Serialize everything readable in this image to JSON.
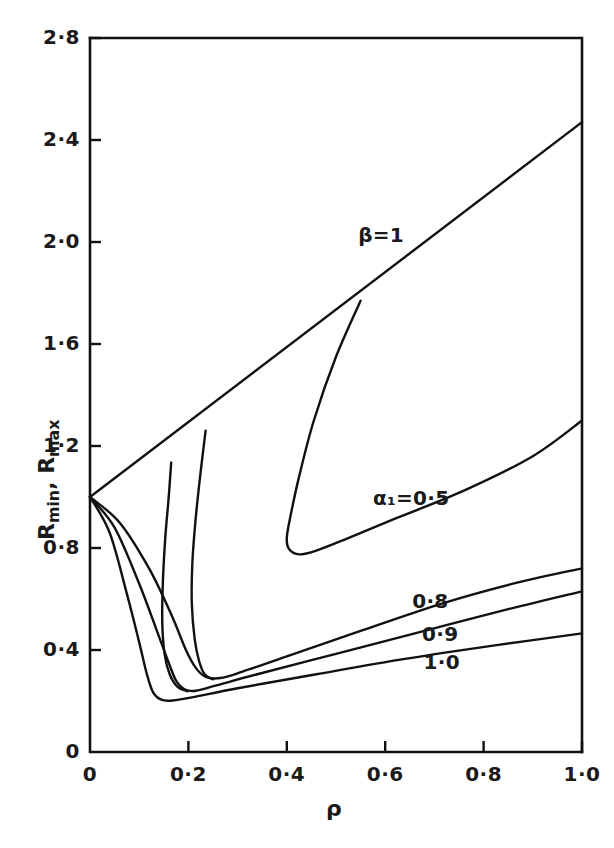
{
  "chart_data": {
    "type": "line",
    "title": "",
    "xlabel": "ρ",
    "ylabel": "R_min, R_max",
    "ylabel_parts": {
      "r1": "R",
      "sub1": "min",
      "comma": ", ",
      "r2": "R",
      "sub2": "max"
    },
    "xlim": [
      0,
      1.0
    ],
    "ylim": [
      0,
      2.8
    ],
    "grid": false,
    "legend": "inline-curve-labels",
    "xticks": [
      0,
      0.2,
      0.4,
      0.6,
      0.8,
      1.0
    ],
    "xtick_labels": [
      "0",
      "0·2",
      "0·4",
      "0·6",
      "0·8",
      "1·0"
    ],
    "yticks": [
      0,
      0.4,
      0.8,
      1.2,
      1.6,
      2.0,
      2.4,
      2.8
    ],
    "ytick_labels": [
      "0",
      "0·4",
      "0·8",
      "1·2",
      "1·6",
      "2·0",
      "2·4",
      "2·8"
    ],
    "origin_point": [
      0,
      1.0
    ],
    "series": [
      {
        "name": "beta=1",
        "label": "β=1",
        "label_pos": [
          0.545,
          2.02
        ],
        "kind": "straight-line",
        "points": [
          [
            0,
            1.0
          ],
          [
            1.0,
            2.47
          ]
        ]
      },
      {
        "name": "alpha1=0.5-upper",
        "label": "",
        "kind": "upper-branch",
        "points": [
          [
            0.55,
            1.77
          ],
          [
            0.5,
            1.55
          ],
          [
            0.455,
            1.3
          ],
          [
            0.425,
            1.08
          ],
          [
            0.408,
            0.93
          ],
          [
            0.4,
            0.84
          ],
          [
            0.405,
            0.795
          ],
          [
            0.425,
            0.775
          ],
          [
            0.46,
            0.79
          ],
          [
            0.52,
            0.835
          ],
          [
            0.62,
            0.915
          ],
          [
            0.76,
            1.025
          ],
          [
            0.9,
            1.16
          ],
          [
            1.0,
            1.3
          ]
        ]
      },
      {
        "name": "alpha1=0.5-label",
        "label": "α₁=0·5",
        "label_pos": [
          0.575,
          0.99
        ]
      },
      {
        "name": "alpha1=0.8",
        "label": "0·8",
        "label_pos": [
          0.655,
          0.585
        ],
        "kind": "u-curve",
        "points": [
          [
            0,
            1.0
          ],
          [
            0.06,
            0.9
          ],
          [
            0.12,
            0.72
          ],
          [
            0.165,
            0.54
          ],
          [
            0.195,
            0.4
          ],
          [
            0.215,
            0.33
          ],
          [
            0.235,
            0.295
          ],
          [
            0.265,
            0.29
          ],
          [
            0.31,
            0.315
          ],
          [
            0.4,
            0.375
          ],
          [
            0.55,
            0.475
          ],
          [
            0.72,
            0.585
          ],
          [
            0.87,
            0.665
          ],
          [
            1.0,
            0.72
          ]
        ]
      },
      {
        "name": "alpha1=0.9",
        "label": "0·9",
        "label_pos": [
          0.675,
          0.455
        ],
        "kind": "u-curve",
        "points": [
          [
            0,
            1.0
          ],
          [
            0.05,
            0.88
          ],
          [
            0.1,
            0.66
          ],
          [
            0.135,
            0.48
          ],
          [
            0.16,
            0.35
          ],
          [
            0.175,
            0.28
          ],
          [
            0.193,
            0.245
          ],
          [
            0.215,
            0.24
          ],
          [
            0.255,
            0.26
          ],
          [
            0.34,
            0.305
          ],
          [
            0.5,
            0.385
          ],
          [
            0.67,
            0.47
          ],
          [
            0.85,
            0.56
          ],
          [
            1.0,
            0.63
          ]
        ]
      },
      {
        "name": "alpha1=1.0",
        "label": "1·0",
        "label_pos": [
          0.678,
          0.345
        ],
        "kind": "u-curve",
        "points": [
          [
            0,
            1.0
          ],
          [
            0.04,
            0.86
          ],
          [
            0.075,
            0.62
          ],
          [
            0.1,
            0.43
          ],
          [
            0.115,
            0.31
          ],
          [
            0.128,
            0.235
          ],
          [
            0.145,
            0.205
          ],
          [
            0.168,
            0.202
          ],
          [
            0.21,
            0.215
          ],
          [
            0.3,
            0.25
          ],
          [
            0.46,
            0.305
          ],
          [
            0.64,
            0.365
          ],
          [
            0.83,
            0.42
          ],
          [
            1.0,
            0.465
          ]
        ]
      },
      {
        "name": "inner-branch-a",
        "label": "",
        "kind": "upper-branch",
        "points": [
          [
            0.235,
            1.26
          ],
          [
            0.225,
            1.1
          ],
          [
            0.215,
            0.92
          ],
          [
            0.208,
            0.74
          ],
          [
            0.207,
            0.58
          ],
          [
            0.213,
            0.44
          ],
          [
            0.222,
            0.355
          ],
          [
            0.233,
            0.305
          ],
          [
            0.25,
            0.285
          ]
        ]
      },
      {
        "name": "inner-branch-b",
        "label": "",
        "kind": "upper-branch",
        "points": [
          [
            0.165,
            1.135
          ],
          [
            0.16,
            1.0
          ],
          [
            0.153,
            0.84
          ],
          [
            0.148,
            0.66
          ],
          [
            0.147,
            0.5
          ],
          [
            0.152,
            0.38
          ],
          [
            0.162,
            0.305
          ],
          [
            0.178,
            0.255
          ],
          [
            0.198,
            0.238
          ]
        ]
      }
    ]
  },
  "figure": {
    "background": "#ffffff",
    "line_color": "#111111"
  }
}
